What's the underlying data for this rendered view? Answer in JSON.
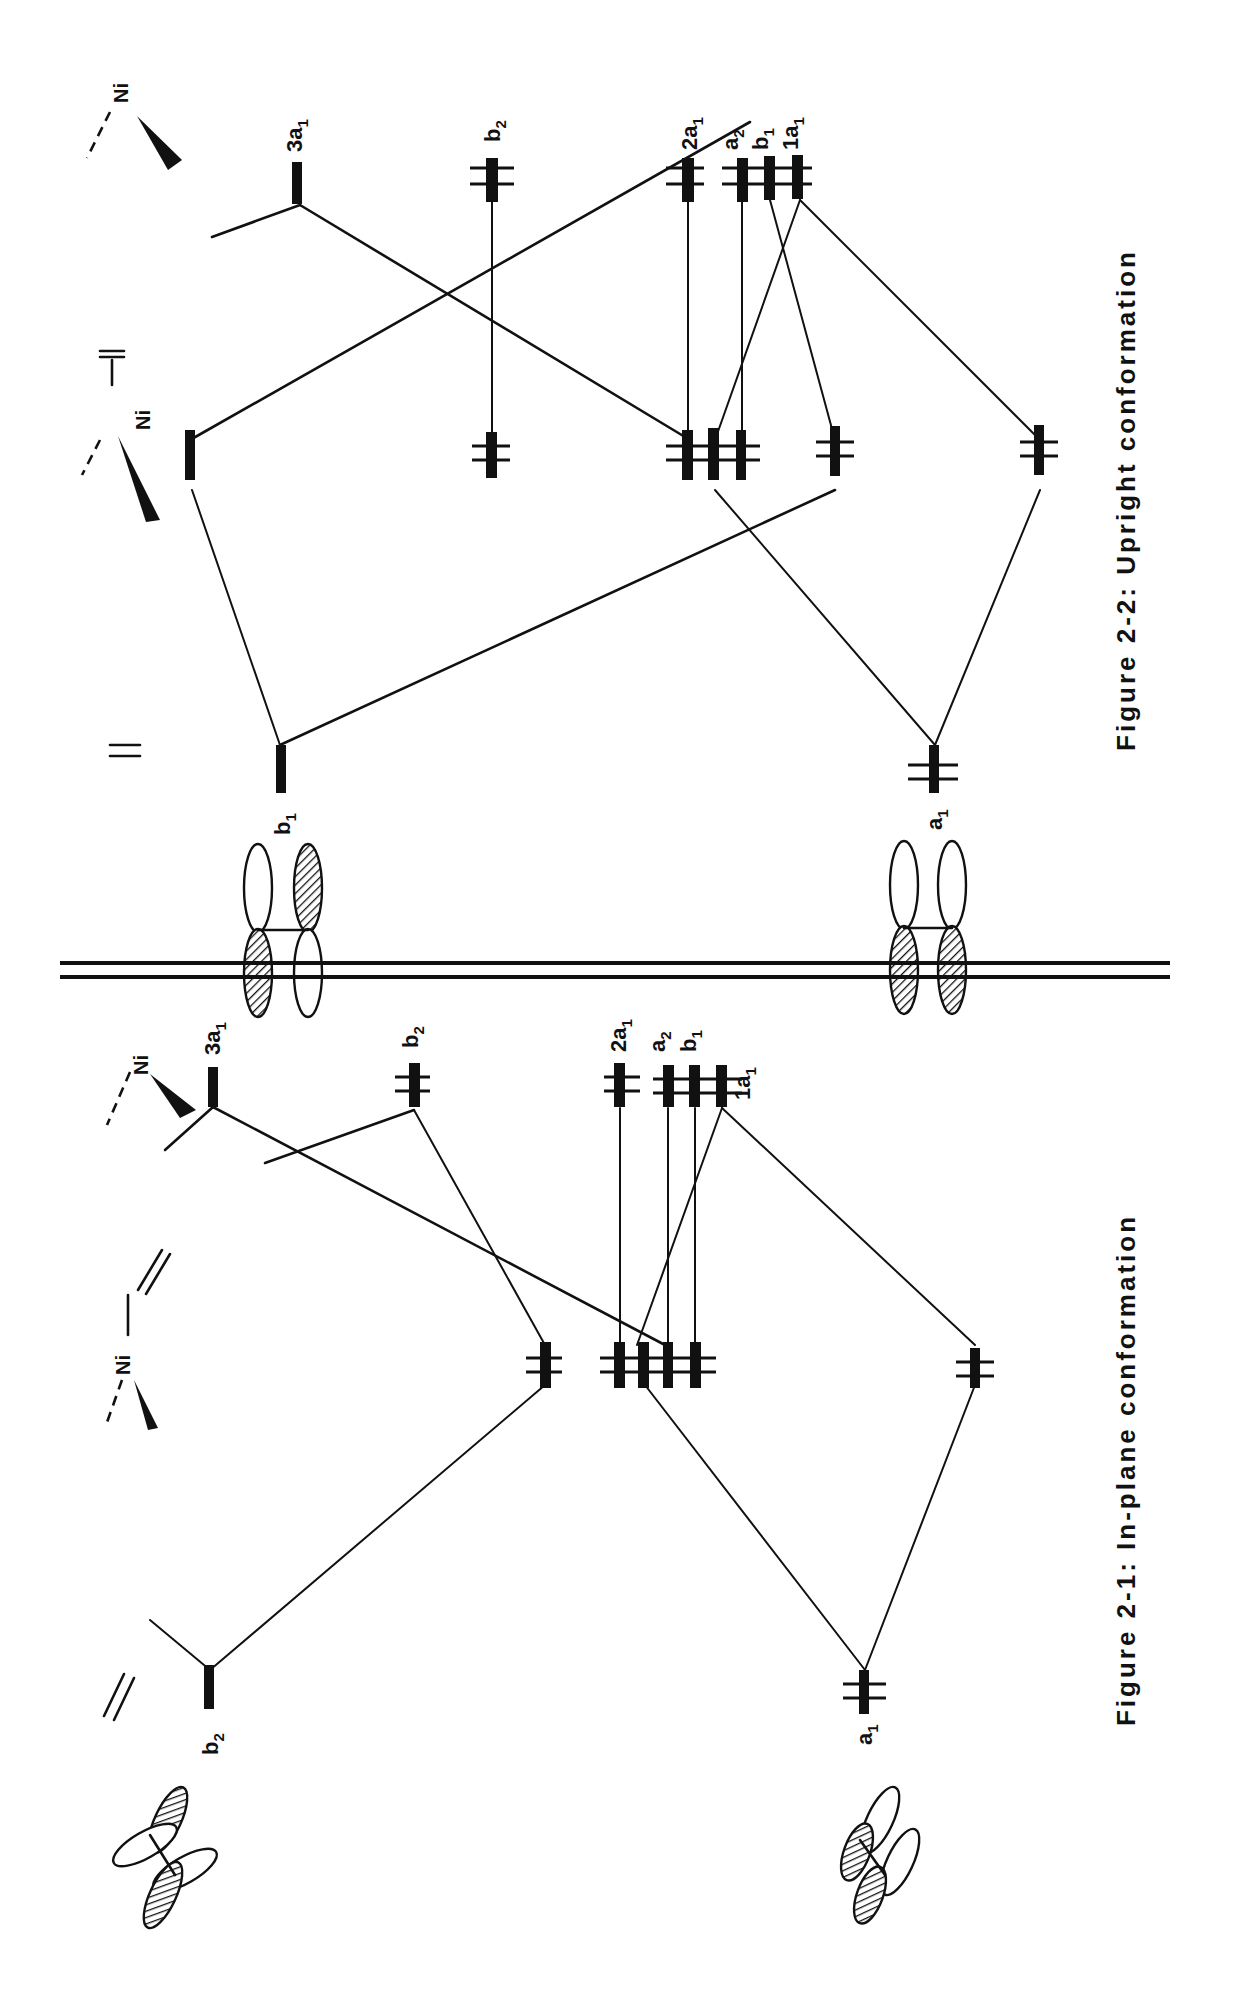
{
  "figures": [
    {
      "id": "fig-2-2",
      "caption": "Figure 2-2:  Upright conformation",
      "fragments": {
        "metal": {
          "label": "Ni"
        },
        "complex": {
          "label": "Ni"
        },
        "ligand": {
          "label": "="
        }
      },
      "ligand_orbitals": [
        {
          "symmetry": "b",
          "sub": "1",
          "occupancy": 0
        },
        {
          "symmetry": "a",
          "sub": "1",
          "occupancy": 2
        }
      ],
      "metal_orbitals": [
        {
          "symmetry": "3a",
          "sub": "1",
          "occupancy": 0
        },
        {
          "symmetry": "b",
          "sub": "2",
          "occupancy": 2
        },
        {
          "symmetry": "2a",
          "sub": "1",
          "occupancy": 2
        },
        {
          "symmetry": "a",
          "sub": "2",
          "occupancy": 2
        },
        {
          "symmetry": "b",
          "sub": "1",
          "occupancy": 2
        },
        {
          "symmetry": "1a",
          "sub": "1",
          "occupancy": 2
        }
      ]
    },
    {
      "id": "fig-2-1",
      "caption": "Figure 2-1:  In-plane conformation",
      "fragments": {
        "metal": {
          "label": "Ni"
        },
        "complex": {
          "label": "Ni"
        },
        "ligand": {
          "label": "="
        }
      },
      "ligand_orbitals": [
        {
          "symmetry": "b",
          "sub": "2",
          "occupancy": 0
        },
        {
          "symmetry": "a",
          "sub": "1",
          "occupancy": 2
        }
      ],
      "metal_orbitals": [
        {
          "symmetry": "3a",
          "sub": "1",
          "occupancy": 0
        },
        {
          "symmetry": "b",
          "sub": "2",
          "occupancy": 2
        },
        {
          "symmetry": "2a",
          "sub": "1",
          "occupancy": 2
        },
        {
          "symmetry": "a",
          "sub": "2",
          "occupancy": 2
        },
        {
          "symmetry": "b",
          "sub": "1",
          "occupancy": 2
        },
        {
          "symmetry": "1a",
          "sub": "1",
          "occupancy": 2
        }
      ]
    }
  ],
  "colors": {
    "ink": "#111111",
    "background": "#ffffff"
  }
}
